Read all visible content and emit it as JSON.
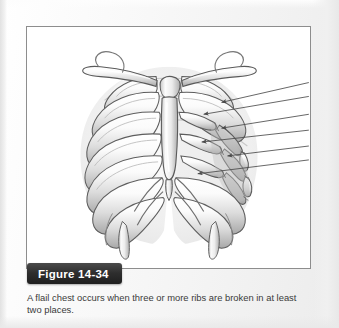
{
  "page": {
    "background_color": "#f2f2f2",
    "panel_background_color": "#ffffff",
    "panel_border_color": "#8d8d8d"
  },
  "figure": {
    "banner_label": "Figure 14-34",
    "banner_color": "#2e2e2e",
    "banner_text_color": "#ffffff",
    "caption": "A flail chest occurs when three or more ribs are broken in at least two places.",
    "caption_text_color": "#3a3a3a"
  },
  "illustration": {
    "title": "anterior view of the human thoracic cage showing a flail chest",
    "style": "grayscale pencil and airbrush medical illustration",
    "bone_fill_color": "#f4f4f4",
    "bone_outline_color": "#5a5a5a",
    "shadow_color": "#b9b9b9",
    "flail_segment_fill_color": "#c9c9c9",
    "leader_line_color": "#555555",
    "structures": [
      "right clavicle",
      "left clavicle",
      "manubrium of sternum",
      "body of sternum",
      "xiphoid process",
      "true ribs 1 to 7",
      "false ribs 8 to 10",
      "floating ribs 11 and 12",
      "costal cartilage",
      "costal margin",
      "flail segment with fractured rib ends"
    ],
    "leader_lines": [
      {
        "id": "fracture-callout-1",
        "target": "posterior fracture of upper flail rib"
      },
      {
        "id": "fracture-callout-2",
        "target": "anterior fracture of upper flail rib"
      },
      {
        "id": "fracture-callout-3",
        "target": "posterior fracture of middle flail rib"
      },
      {
        "id": "fracture-callout-4",
        "target": "anterior fracture of middle flail rib"
      },
      {
        "id": "fracture-callout-5",
        "target": "posterior fracture of lower flail rib"
      },
      {
        "id": "fracture-callout-6",
        "target": "anterior fracture of lower flail rib"
      }
    ]
  }
}
